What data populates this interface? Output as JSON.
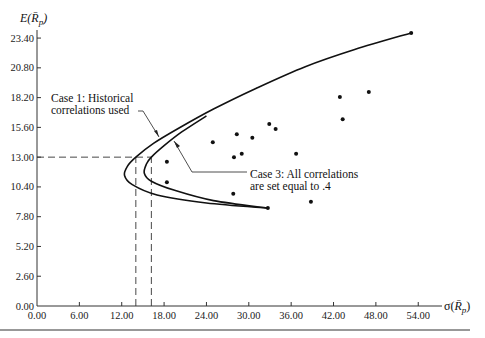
{
  "chart_data": {
    "type": "scatter",
    "title": "",
    "xlabel": "σ(R̄p)",
    "ylabel": "E(R̄p)",
    "xlim": [
      0,
      56
    ],
    "ylim": [
      0,
      24.5
    ],
    "grid": false,
    "x_ticks": [
      "0.00",
      "6.00",
      "12.00",
      "18.00",
      "24.00",
      "30.00",
      "36.00",
      "42.00",
      "48.00",
      "54.00"
    ],
    "y_ticks": [
      "0.00",
      "2.60",
      "5.20",
      "7.80",
      "10.40",
      "13.00",
      "15.60",
      "18.20",
      "20.80",
      "23.40"
    ],
    "series": [
      {
        "name": "Individual securities",
        "type": "scatter",
        "points": [
          {
            "x": 53.0,
            "y": 23.85
          },
          {
            "x": 47.0,
            "y": 18.7
          },
          {
            "x": 42.9,
            "y": 18.25
          },
          {
            "x": 43.3,
            "y": 16.3
          },
          {
            "x": 32.9,
            "y": 15.9
          },
          {
            "x": 33.8,
            "y": 15.45
          },
          {
            "x": 28.3,
            "y": 15.0
          },
          {
            "x": 30.5,
            "y": 14.7
          },
          {
            "x": 24.9,
            "y": 14.3
          },
          {
            "x": 27.9,
            "y": 13.0
          },
          {
            "x": 29.0,
            "y": 13.3
          },
          {
            "x": 36.7,
            "y": 13.3
          },
          {
            "x": 18.4,
            "y": 12.6
          },
          {
            "x": 18.4,
            "y": 10.8
          },
          {
            "x": 27.8,
            "y": 9.8
          },
          {
            "x": 38.8,
            "y": 9.1
          },
          {
            "x": 32.7,
            "y": 8.55
          }
        ]
      },
      {
        "name": "Case 1: Historical correlations used",
        "type": "line",
        "points": [
          {
            "x": 32.7,
            "y": 8.55
          },
          {
            "x": 24.0,
            "y": 9.0
          },
          {
            "x": 17.0,
            "y": 9.7
          },
          {
            "x": 13.5,
            "y": 10.6
          },
          {
            "x": 12.4,
            "y": 11.4
          },
          {
            "x": 12.8,
            "y": 12.2
          },
          {
            "x": 14.0,
            "y": 13.0
          },
          {
            "x": 16.5,
            "y": 14.2
          },
          {
            "x": 20.0,
            "y": 15.5
          },
          {
            "x": 25.0,
            "y": 17.2
          },
          {
            "x": 31.0,
            "y": 19.0
          },
          {
            "x": 38.0,
            "y": 20.9
          },
          {
            "x": 45.0,
            "y": 22.4
          },
          {
            "x": 53.0,
            "y": 23.85
          }
        ]
      },
      {
        "name": "Case 3: All correlations are set equal to .4",
        "type": "line",
        "points": [
          {
            "x": 32.7,
            "y": 8.55
          },
          {
            "x": 25.0,
            "y": 9.2
          },
          {
            "x": 19.5,
            "y": 10.1
          },
          {
            "x": 16.2,
            "y": 10.9
          },
          {
            "x": 15.2,
            "y": 11.6
          },
          {
            "x": 15.5,
            "y": 12.4
          },
          {
            "x": 16.2,
            "y": 13.0
          },
          {
            "x": 18.0,
            "y": 14.0
          },
          {
            "x": 20.5,
            "y": 15.2
          },
          {
            "x": 24.0,
            "y": 16.6
          }
        ]
      }
    ],
    "reference_lines": [
      {
        "type": "horizontal",
        "y": 13.0,
        "x_to": 16.2,
        "style": "dashed"
      },
      {
        "type": "vertical",
        "x": 14.0,
        "y_to": 13.0,
        "style": "dashed"
      },
      {
        "type": "vertical",
        "x": 16.2,
        "y_to": 13.0,
        "style": "dashed"
      }
    ],
    "annotations": [
      {
        "text": "Case 1: Historical",
        "text2": "correlations used",
        "target": "Case 1 curve"
      },
      {
        "text": "Case 3: All correlations",
        "text2": "are set equal to .4",
        "target": "Case 3 curve"
      }
    ]
  },
  "labels": {
    "y_axis": "E(R̄p)",
    "x_axis": "σ(R̄p)",
    "case1_line1": "Case 1: Historical",
    "case1_line2": "correlations used",
    "case3_line1": "Case 3: All correlations",
    "case3_line2": "are set equal to .4"
  }
}
